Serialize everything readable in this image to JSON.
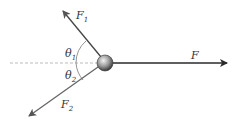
{
  "diagram": {
    "labels": {
      "f1": "F",
      "f1_sub": "1",
      "f2": "F",
      "f2_sub": "2",
      "f": "F",
      "theta1": "θ",
      "theta1_sub": "1",
      "theta2": "θ",
      "theta2_sub": "2"
    },
    "colors": {
      "arrow_dark": "#2a2a2a",
      "arrow_gray": "#666666",
      "dashed": "#bbbbbb",
      "ball": "#888888"
    }
  }
}
